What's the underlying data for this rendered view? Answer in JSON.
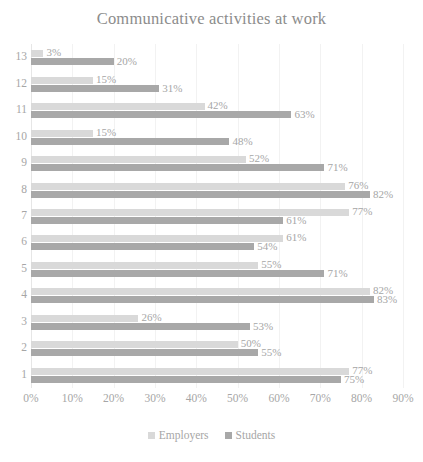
{
  "chart_data": {
    "type": "bar",
    "orientation": "horizontal",
    "title": "Communicative activities at work",
    "xlabel": "",
    "ylabel": "",
    "xlim": [
      0,
      90
    ],
    "x_tick_labels": [
      "0%",
      "10%",
      "20%",
      "30%",
      "40%",
      "50%",
      "60%",
      "70%",
      "80%",
      "90%"
    ],
    "x_tick_values": [
      0,
      10,
      20,
      30,
      40,
      50,
      60,
      70,
      80,
      90
    ],
    "grid": true,
    "legend_position": "bottom",
    "categories": [
      "13",
      "12",
      "11",
      "10",
      "9",
      "8",
      "7",
      "6",
      "5",
      "4",
      "3",
      "2",
      "1"
    ],
    "series": [
      {
        "name": "Employers",
        "color": "#d9d9d9",
        "values": [
          3,
          15,
          42,
          15,
          52,
          76,
          77,
          61,
          55,
          82,
          26,
          50,
          77
        ],
        "value_labels": [
          "3%",
          "15%",
          "42%",
          "15%",
          "52%",
          "76%",
          "77%",
          "61%",
          "55%",
          "82%",
          "26%",
          "50%",
          "77%"
        ]
      },
      {
        "name": "Students",
        "color": "#a8a8a8",
        "values": [
          20,
          31,
          63,
          48,
          71,
          82,
          61,
          54,
          71,
          83,
          53,
          55,
          75
        ],
        "value_labels": [
          "20%",
          "31%",
          "63%",
          "48%",
          "71%",
          "82%",
          "61%",
          "54%",
          "71%",
          "83%",
          "53%",
          "55%",
          "75%"
        ]
      }
    ]
  },
  "legend": {
    "items": [
      {
        "label": "Employers",
        "color": "#d9d9d9"
      },
      {
        "label": "Students",
        "color": "#a8a8a8"
      }
    ]
  },
  "colors": {
    "title": "#8c8c8c",
    "tick_text": "#a6a6a6",
    "gridline": "#f2f2f2",
    "background": "#ffffff"
  }
}
